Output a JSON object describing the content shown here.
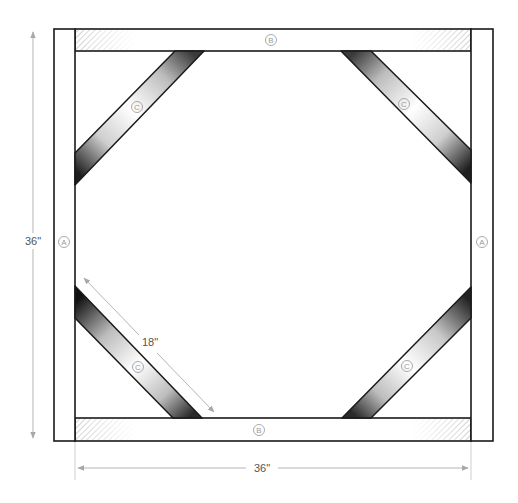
{
  "diagram": {
    "type": "frame-assembly",
    "parts": {
      "post_label": "A",
      "rail_label": "B",
      "brace_label": "C"
    },
    "dimensions": {
      "height": "36\"",
      "width": "36\"",
      "brace_length": "18\""
    },
    "colors": {
      "outline": "#1a1a1a",
      "dimension_line": "#b5b5b5",
      "label_circle": "#a0a0a0",
      "hatch": "#9a9a9a",
      "brace_shade_dark": "#2a2a2a",
      "brace_shade_light": "#ffffff"
    }
  }
}
